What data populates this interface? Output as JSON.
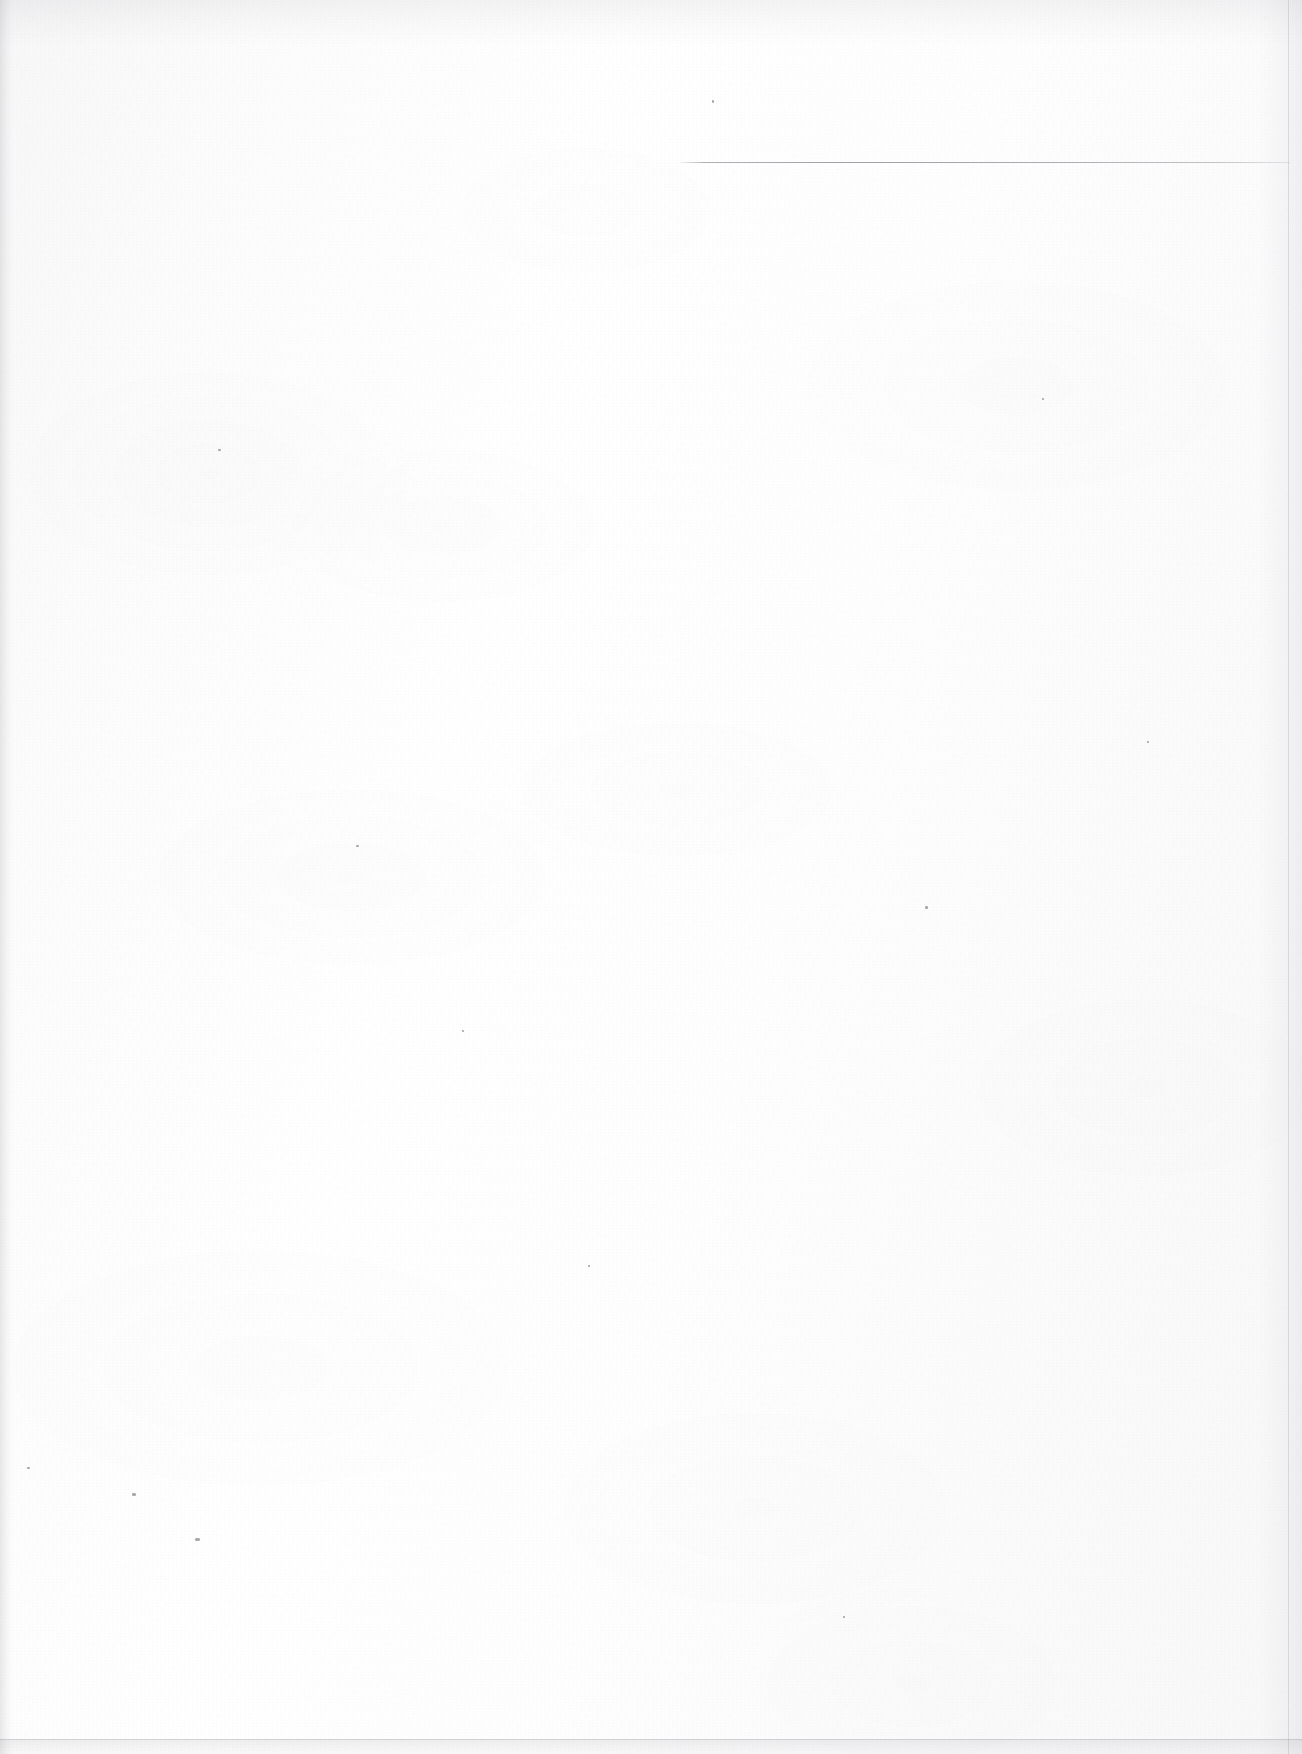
{
  "document": {
    "kind": "scanned-page",
    "description": "Blank scanned book page",
    "page_text": "",
    "visible_text_count": 0,
    "background_color": "#fdfdfd",
    "ink_color": "#787884",
    "width": 1302,
    "height": 1754
  },
  "marks": {
    "header_rule": {
      "label": "horizontal rule",
      "x": 680,
      "y": 162,
      "width": 610,
      "height": 1,
      "color": "#7c7c86"
    }
  },
  "scan_artifacts": {
    "left_edge_shadow": {
      "label": "left edge shadow",
      "x": 0,
      "y": 0,
      "width": 13,
      "height": 1754
    },
    "top_edge_tone": {
      "label": "top edge tone",
      "x": 0,
      "y": 0,
      "width": 1302,
      "height": 46
    },
    "right_edge_line": {
      "label": "right page edge",
      "x": 1288,
      "y": 0,
      "width": 1,
      "height": 1754
    },
    "right_edge_fade": {
      "label": "right edge fade",
      "x": 1258,
      "y": 0,
      "width": 44,
      "height": 1754
    },
    "bottom_edge_rule": {
      "label": "bottom page edge",
      "x": 0,
      "y": 1739,
      "width": 1302,
      "height": 1
    },
    "bottom_edge_band": {
      "label": "bottom grey band",
      "x": 0,
      "y": 1740,
      "width": 1302,
      "height": 14
    }
  },
  "specks": [
    {
      "x": 195,
      "y": 1538,
      "w": 5,
      "h": 3
    },
    {
      "x": 132,
      "y": 1493,
      "w": 4,
      "h": 3
    },
    {
      "x": 925,
      "y": 906,
      "w": 3,
      "h": 3
    },
    {
      "x": 356,
      "y": 845,
      "w": 3,
      "h": 2
    },
    {
      "x": 27,
      "y": 1467,
      "w": 3,
      "h": 2
    },
    {
      "x": 712,
      "y": 100,
      "w": 2,
      "h": 3
    },
    {
      "x": 218,
      "y": 449,
      "w": 3,
      "h": 2
    },
    {
      "x": 1147,
      "y": 741,
      "w": 2,
      "h": 2
    },
    {
      "x": 588,
      "y": 1265,
      "w": 2,
      "h": 2
    },
    {
      "x": 843,
      "y": 1616,
      "w": 2,
      "h": 2
    },
    {
      "x": 462,
      "y": 1030,
      "w": 2,
      "h": 2
    },
    {
      "x": 1042,
      "y": 398,
      "w": 2,
      "h": 2
    }
  ]
}
